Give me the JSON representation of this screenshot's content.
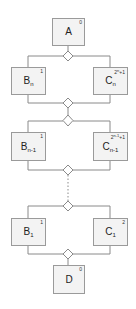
{
  "diagram": {
    "type": "flow-with-branches",
    "nodes": [
      {
        "id": "A",
        "label": "A",
        "sub": "",
        "num": "0",
        "num_exp": "",
        "num_tail": ""
      },
      {
        "id": "Bn",
        "label": "B",
        "sub": "n",
        "num": "1",
        "num_exp": "",
        "num_tail": ""
      },
      {
        "id": "Cn",
        "label": "C",
        "sub": "n",
        "num": "2",
        "num_exp": "n",
        "num_tail": "+1"
      },
      {
        "id": "Bn1",
        "label": "B",
        "sub": "n-1",
        "num": "1",
        "num_exp": "",
        "num_tail": ""
      },
      {
        "id": "Cn1",
        "label": "C",
        "sub": "n-1",
        "num": "2",
        "num_exp": "n-1",
        "num_tail": "+1"
      },
      {
        "id": "B1",
        "label": "B",
        "sub": "1",
        "num": "1",
        "num_exp": "",
        "num_tail": ""
      },
      {
        "id": "C1",
        "label": "C",
        "sub": "1",
        "num": "2",
        "num_exp": "",
        "num_tail": ""
      },
      {
        "id": "D",
        "label": "D",
        "sub": "",
        "num": "0",
        "num_exp": "",
        "num_tail": ""
      }
    ],
    "gateways": [
      "split-n",
      "join-n",
      "split-n-1",
      "join-n-1",
      "split-1",
      "join-1"
    ],
    "ellipsis": "dotted continuation between stage n-1 and stage 1",
    "colors": {
      "box_fill": "#f3f3f3",
      "box_border": "#9a9a9a",
      "line": "#8a8a8a",
      "text": "#222222"
    }
  }
}
